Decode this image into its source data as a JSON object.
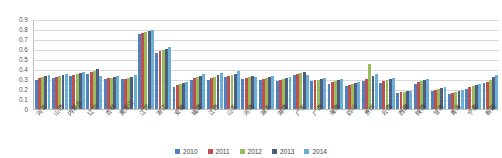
{
  "chart_data": {
    "type": "bar",
    "title": "",
    "xlabel": "",
    "ylabel": "",
    "ylim": [
      0,
      0.9
    ],
    "grid": true,
    "legend_position": "bottom",
    "y_ticks": [
      "0.9",
      "0.8",
      "0.7",
      "0.6",
      "0.5",
      "0.4",
      "0.3",
      "0.2",
      "0.1",
      "0"
    ],
    "y_tick_values": [
      0.9,
      0.8,
      0.7,
      0.6,
      0.5,
      0.4,
      0.3,
      0.2,
      0.1,
      0
    ],
    "categories": [
      "河北",
      "山西",
      "内蒙古",
      "辽宁",
      "吉林",
      "黑龙江",
      "江苏",
      "浙江",
      "安徽",
      "福建",
      "江西",
      "山东",
      "河南",
      "湖北",
      "湖南",
      "广东",
      "广西",
      "海南",
      "四川",
      "贵州",
      "云南",
      "西藏",
      "陕西",
      "甘肃",
      "青海",
      "宁夏",
      "新疆"
    ],
    "series": [
      {
        "name": "2010",
        "color": "#4E81BD",
        "values": [
          0.29,
          0.31,
          0.33,
          0.35,
          0.3,
          0.3,
          0.75,
          0.56,
          0.22,
          0.29,
          0.29,
          0.32,
          0.3,
          0.29,
          0.28,
          0.34,
          0.28,
          0.25,
          0.23,
          0.28,
          0.26,
          0.16,
          0.25,
          0.18,
          0.15,
          0.2,
          0.26
        ]
      },
      {
        "name": "2011",
        "color": "#C0504D",
        "values": [
          0.31,
          0.32,
          0.34,
          0.37,
          0.31,
          0.3,
          0.76,
          0.58,
          0.24,
          0.31,
          0.31,
          0.33,
          0.31,
          0.3,
          0.29,
          0.35,
          0.29,
          0.27,
          0.24,
          0.3,
          0.28,
          0.17,
          0.27,
          0.19,
          0.16,
          0.22,
          0.27
        ]
      },
      {
        "name": "2012",
        "color": "#9BBB59",
        "values": [
          0.32,
          0.33,
          0.35,
          0.38,
          0.31,
          0.31,
          0.77,
          0.59,
          0.25,
          0.32,
          0.32,
          0.34,
          0.32,
          0.31,
          0.3,
          0.36,
          0.29,
          0.28,
          0.25,
          0.45,
          0.29,
          0.17,
          0.28,
          0.2,
          0.17,
          0.23,
          0.29
        ]
      },
      {
        "name": "2013",
        "color": "#4F5D82",
        "values": [
          0.33,
          0.34,
          0.36,
          0.4,
          0.32,
          0.32,
          0.78,
          0.6,
          0.26,
          0.33,
          0.34,
          0.35,
          0.33,
          0.32,
          0.31,
          0.37,
          0.3,
          0.29,
          0.26,
          0.33,
          0.3,
          0.18,
          0.29,
          0.21,
          0.18,
          0.24,
          0.32
        ]
      },
      {
        "name": "2014",
        "color": "#6BAED6",
        "values": [
          0.34,
          0.35,
          0.37,
          0.33,
          0.33,
          0.34,
          0.79,
          0.62,
          0.27,
          0.35,
          0.36,
          0.38,
          0.32,
          0.33,
          0.32,
          0.34,
          0.31,
          0.3,
          0.27,
          0.35,
          0.31,
          0.18,
          0.3,
          0.22,
          0.19,
          0.25,
          0.34
        ]
      }
    ]
  }
}
